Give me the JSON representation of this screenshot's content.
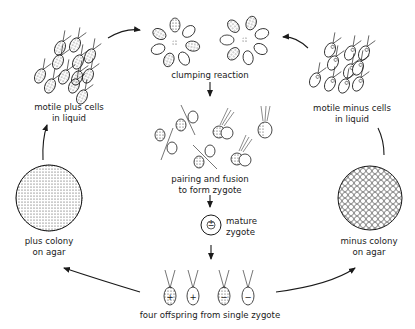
{
  "diagram": {
    "title": "",
    "stages": [
      {
        "id": "motile-plus",
        "label_line1": "motile plus cells",
        "label_line2": "in liquid"
      },
      {
        "id": "clumping",
        "label_line1": "clumping reaction"
      },
      {
        "id": "motile-minus",
        "label_line1": "motile minus cells",
        "label_line2": "in liquid"
      },
      {
        "id": "pairing",
        "label_line1": "pairing and fusion",
        "label_line2": "to form zygote"
      },
      {
        "id": "mature-zygote",
        "label_line1": "mature",
        "label_line2": "zygote",
        "symbol": "±"
      },
      {
        "id": "plus-colony",
        "label_line1": "plus colony",
        "label_line2": "on agar"
      },
      {
        "id": "minus-colony",
        "label_line1": "minus colony",
        "label_line2": "on agar"
      },
      {
        "id": "offspring",
        "label_line1": "four offspring from single zygote",
        "symbols": [
          "+",
          "+",
          "−",
          "−"
        ]
      }
    ],
    "edges": [
      {
        "from": "motile-plus",
        "to": "clumping"
      },
      {
        "from": "motile-minus",
        "to": "clumping"
      },
      {
        "from": "clumping",
        "to": "pairing"
      },
      {
        "from": "pairing",
        "to": "mature-zygote"
      },
      {
        "from": "mature-zygote",
        "to": "offspring"
      },
      {
        "from": "offspring",
        "to": "plus-colony"
      },
      {
        "from": "offspring",
        "to": "minus-colony"
      },
      {
        "from": "plus-colony",
        "to": "motile-plus"
      },
      {
        "from": "minus-colony",
        "to": "motile-minus"
      }
    ],
    "colors": {
      "ink": "#1a1a1a",
      "background": "#ffffff"
    }
  }
}
